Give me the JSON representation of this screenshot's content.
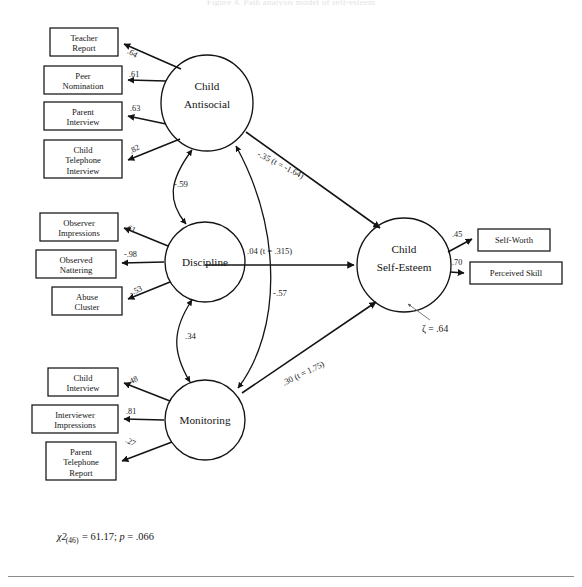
{
  "figure": {
    "title": "Figure 4. Path analysis model of self-esteem",
    "fit": {
      "chi_symbol": "χ2",
      "df": "(46)",
      "chi_value": "= 61.17;",
      "p_text": "= .066",
      "p_symbol": "p"
    },
    "disturbance": {
      "symbol": "ζ",
      "text": "= .64",
      "full": "ζ = .64"
    }
  },
  "latents": [
    {
      "id": "antisocial",
      "line1": "Child",
      "line2": "Antisocial"
    },
    {
      "id": "discipline",
      "line1": "Discipline",
      "line2": ""
    },
    {
      "id": "monitoring",
      "line1": "Monitoring",
      "line2": ""
    },
    {
      "id": "selfesteem",
      "line1": "Child",
      "line2": "Self-Esteem"
    }
  ],
  "indicators": {
    "antisocial": [
      {
        "line1": "Teacher",
        "line2": "Report",
        "line3": "",
        "loading": ".64"
      },
      {
        "line1": "Peer",
        "line2": "Nomination",
        "line3": "",
        "loading": ".61"
      },
      {
        "line1": "Parent",
        "line2": "Interview",
        "line3": "",
        "loading": ".63"
      },
      {
        "line1": "Child",
        "line2": "Telephone",
        "line3": "Interview",
        "loading": ".82"
      }
    ],
    "discipline": [
      {
        "line1": "Observer",
        "line2": "Impressions",
        "line3": "",
        "loading": ".61"
      },
      {
        "line1": "Observed",
        "line2": "Nattering",
        "line3": "",
        "loading": "-.98"
      },
      {
        "line1": "Abuse",
        "line2": "Cluster",
        "line3": "",
        "loading": "-.53"
      }
    ],
    "monitoring": [
      {
        "line1": "Child",
        "line2": "Interview",
        "line3": "",
        "loading": ".48"
      },
      {
        "line1": "Interviewer",
        "line2": "Impressions",
        "line3": "",
        "loading": ".81"
      },
      {
        "line1": "Parent",
        "line2": "Telephone",
        "line3": "Report",
        "loading": ".27"
      }
    ],
    "selfesteem": [
      {
        "line1": "Self-Worth",
        "line2": "",
        "line3": "",
        "loading": ".45"
      },
      {
        "line1": "Perceived Skill",
        "line2": "",
        "line3": "",
        "loading": ".70"
      }
    ]
  },
  "structural_paths": [
    {
      "from": "antisocial",
      "to": "selfesteem",
      "coef": "-.35",
      "stat_label": "t",
      "stat": "= -1.64",
      "full": "-.35 (t = -1.64)"
    },
    {
      "from": "discipline",
      "to": "selfesteem",
      "coef": ".04",
      "stat_label": "t",
      "stat": "= .315",
      "full": ".04 (t = .315)"
    },
    {
      "from": "monitoring",
      "to": "selfesteem",
      "coef": ".30",
      "stat_label": "t",
      "stat": "= 1.75",
      "full": ".30 (t = 1.75)"
    }
  ],
  "covariances": [
    {
      "between": "antisocial-discipline",
      "value": "-.59"
    },
    {
      "between": "antisocial-monitoring",
      "value": "-.57"
    },
    {
      "between": "discipline-monitoring",
      "value": ".34"
    }
  ]
}
